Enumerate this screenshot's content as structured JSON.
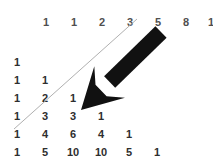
{
  "figure": {
    "background_color": "#ffffff",
    "width": 213,
    "height": 158
  },
  "fibonacci_row": {
    "label": "fibonacci-sequence-row",
    "color": "#4f4f4f",
    "y": 17,
    "start_x": 46,
    "spacing": 28,
    "values": [
      "1",
      "1",
      "2",
      "3",
      "5",
      "8",
      "13",
      "21"
    ]
  },
  "pascal_triangle": {
    "label": "pascals-triangle",
    "color": "#2e2e2e",
    "start_x": 17,
    "start_y": 57,
    "row_spacing": 18,
    "col_spacing": 28,
    "rows": [
      [
        "1"
      ],
      [
        "1",
        "1"
      ],
      [
        "1",
        "2",
        "1"
      ],
      [
        "1",
        "3",
        "3",
        "1"
      ],
      [
        "1",
        "4",
        "6",
        "4",
        "1"
      ],
      [
        "1",
        "5",
        "10",
        "10",
        "5",
        "1"
      ]
    ]
  },
  "diagonal_line": {
    "label": "shallow-diagonal-line",
    "color": "#b0b0b0",
    "width": 1,
    "x1": 14,
    "y1": 129,
    "x2": 137,
    "y2": 19
  },
  "arrow": {
    "label": "bold-down-left-arrow",
    "color": "#111111",
    "tail_x": 161,
    "tail_y": 32,
    "tip_x": 81,
    "tip_y": 110
  },
  "chart_data": {
    "type": "table",
    "title": "",
    "xlabel": "",
    "ylabel": "",
    "grid": false,
    "legend": "none",
    "header_series": {
      "name": "Fibonacci sums of shallow diagonals",
      "values": [
        1,
        1,
        2,
        3,
        5,
        8,
        13,
        21
      ]
    },
    "rows": [
      {
        "n": 0,
        "values": [
          1
        ]
      },
      {
        "n": 1,
        "values": [
          1,
          1
        ]
      },
      {
        "n": 2,
        "values": [
          1,
          2,
          1
        ]
      },
      {
        "n": 3,
        "values": [
          1,
          3,
          3,
          1
        ]
      },
      {
        "n": 4,
        "values": [
          1,
          4,
          6,
          4,
          1
        ]
      },
      {
        "n": 5,
        "values": [
          1,
          5,
          10,
          10,
          5,
          1
        ]
      }
    ],
    "annotations": [
      {
        "kind": "line",
        "label": "shallow-diagonal",
        "from": [
          14,
          129
        ],
        "to": [
          137,
          19
        ]
      },
      {
        "kind": "arrow",
        "label": "pointer-arrow",
        "from": [
          161,
          32
        ],
        "to": [
          81,
          110
        ]
      }
    ]
  }
}
